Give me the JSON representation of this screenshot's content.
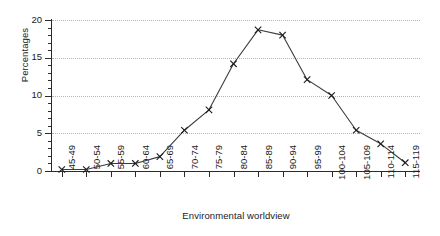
{
  "chart_data": {
    "type": "line",
    "title": "",
    "xlabel": "Environmental worldview",
    "ylabel": "Percentages",
    "categories": [
      "45-49",
      "50-54",
      "55-59",
      "60-64",
      "65-69",
      "70-74",
      "75-79",
      "80-84",
      "85-89",
      "90-94",
      "95-99",
      "100-104",
      "105-109",
      "110-114",
      "115-119"
    ],
    "values": [
      0.2,
      0.2,
      1.0,
      1.0,
      1.9,
      5.4,
      8.1,
      14.2,
      18.7,
      18.0,
      12.1,
      10.0,
      5.4,
      3.6,
      1.1
    ],
    "ylim": [
      0,
      20
    ],
    "yticks": [
      0,
      5,
      10,
      15,
      20
    ],
    "ytick_labels": [
      "0",
      "5",
      "10",
      "15",
      "20"
    ],
    "yminor_step": 1,
    "grid": true,
    "grid_style": "dotted",
    "legend": "none",
    "marker": "x-cross",
    "line_color": "#3c3c3c",
    "marker_color": "#1a1a1a",
    "grid_color": "#b4b4b4",
    "axis_color": "#2b2b2b"
  }
}
